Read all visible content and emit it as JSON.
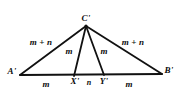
{
  "figure": {
    "type": "geometry-diagram",
    "background_color": "#ffffff",
    "stroke_color": "#111111",
    "text_color": "#0d0d0d",
    "vertices": [
      {
        "key": "A",
        "label": "A'",
        "x": 20,
        "y": 75,
        "label_x": 12,
        "label_y": 71
      },
      {
        "key": "C",
        "label": "C'",
        "x": 86,
        "y": 26,
        "label_x": 86,
        "label_y": 18
      },
      {
        "key": "B",
        "label": "B'",
        "x": 162,
        "y": 74,
        "label_x": 169,
        "label_y": 70
      },
      {
        "key": "X",
        "label": "X'",
        "x": 74,
        "y": 76,
        "label_x": 75,
        "label_y": 81
      },
      {
        "key": "Y",
        "label": "Y'",
        "x": 104,
        "y": 75,
        "label_x": 104,
        "label_y": 81
      }
    ],
    "segments": [
      {
        "key": "AC",
        "from": "A",
        "to": "C",
        "role": "left-side"
      },
      {
        "key": "CB",
        "from": "C",
        "to": "B",
        "role": "right-side"
      },
      {
        "key": "AB",
        "from": "A",
        "to": "B",
        "role": "base"
      },
      {
        "key": "CX",
        "from": "C",
        "to": "X",
        "role": "left-cevian"
      },
      {
        "key": "CY",
        "from": "C",
        "to": "Y",
        "role": "right-cevian"
      }
    ],
    "labels": {
      "left_side": {
        "text": "m + n",
        "x": 41,
        "y": 42
      },
      "right_side": {
        "text": "m + n",
        "x": 133,
        "y": 42
      },
      "left_cevian": {
        "text": "m",
        "x": 69,
        "y": 51
      },
      "right_cevian": {
        "text": "m",
        "x": 104,
        "y": 51
      },
      "base_left": {
        "text": "m",
        "x": 46,
        "y": 84
      },
      "base_middle": {
        "text": "n",
        "x": 89,
        "y": 83
      },
      "base_right": {
        "text": "m",
        "x": 129,
        "y": 84
      }
    }
  }
}
